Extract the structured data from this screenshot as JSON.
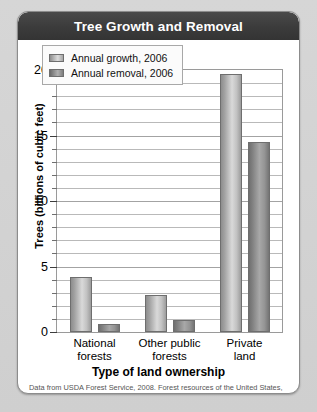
{
  "card": {
    "title": "Tree Growth and Removal"
  },
  "chart_data": {
    "type": "bar",
    "title": "Tree Growth and Removal",
    "xlabel": "Type of land ownership",
    "ylabel": "Trees (billions of cubic feet)",
    "ylim": [
      0,
      20
    ],
    "ytick_labels": [
      "0",
      "5",
      "10",
      "15",
      "20"
    ],
    "ytick_values": [
      0,
      5,
      10,
      15,
      20
    ],
    "minor_gridline_step": 1,
    "grid": true,
    "legend_position": "top-left-inside",
    "categories": [
      "National forests",
      "Other public forests",
      "Private land"
    ],
    "category_lines": [
      [
        "National",
        "forests"
      ],
      [
        "Other public",
        "forests"
      ],
      [
        "Private",
        "land"
      ]
    ],
    "series": [
      {
        "name": "Annual growth, 2006",
        "values": [
          4.2,
          2.8,
          19.7
        ],
        "color": "#c2c2c2"
      },
      {
        "name": "Annual removal, 2006",
        "values": [
          0.6,
          0.9,
          14.5
        ],
        "color": "#8d8d8d"
      }
    ],
    "source": "Data from USDA Forest Service, 2008. Forest resources of the United States, 2007. U.S. Department of Agriculture, Washington, D.C."
  }
}
